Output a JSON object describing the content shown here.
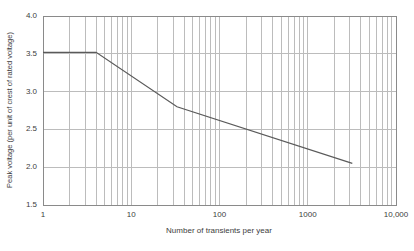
{
  "chart_data": {
    "type": "line",
    "title": "",
    "xlabel": "Number of transients per year",
    "ylabel": "Peak voltage (per unit of crest of rated voltage)",
    "x_scale": "log",
    "xlim": [
      1,
      10000
    ],
    "ylim": [
      1.5,
      4.0
    ],
    "grid": "on",
    "legend": "none",
    "x_ticks": [
      {
        "v": 1,
        "label": "1"
      },
      {
        "v": 10,
        "label": "10"
      },
      {
        "v": 100,
        "label": "100"
      },
      {
        "v": 1000,
        "label": "1000"
      },
      {
        "v": 10000,
        "label": "10,000"
      }
    ],
    "y_ticks": [
      {
        "v": 1.5,
        "label": "1.5"
      },
      {
        "v": 2.0,
        "label": "2.0"
      },
      {
        "v": 2.5,
        "label": "2.5"
      },
      {
        "v": 3.0,
        "label": "3.0"
      },
      {
        "v": 3.5,
        "label": "3.5"
      },
      {
        "v": 4.0,
        "label": "4.0"
      }
    ],
    "series": [
      {
        "name": "peak-voltage-limit-curve",
        "points": [
          [
            1,
            3.52
          ],
          [
            4,
            3.52
          ],
          [
            33,
            2.8
          ],
          [
            3200,
            2.05
          ]
        ]
      }
    ],
    "colors": {
      "background": "#ffffff",
      "grid": "#bcbcbc",
      "frame": "#8a8a8a",
      "line": "#5a5a5a",
      "text": "#3d3d3d"
    }
  }
}
